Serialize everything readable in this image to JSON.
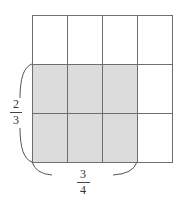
{
  "figure": {
    "grid": {
      "columns": 4,
      "rows": 3,
      "left": 32,
      "top": 15,
      "cell_width": 35,
      "cell_height": 49,
      "line_color": "#6e6e6e",
      "shaded_columns": [
        0,
        1,
        2
      ],
      "shaded_rows": [
        1,
        2
      ],
      "shade_color": "#dcdcdc"
    },
    "vertical_label": {
      "numerator": "2",
      "denominator": "3"
    },
    "horizontal_label": {
      "numerator": "3",
      "denominator": "4"
    }
  }
}
